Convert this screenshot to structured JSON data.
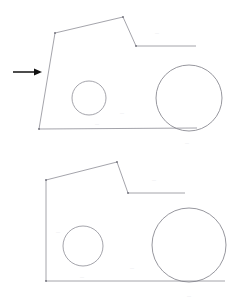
{
  "document": {
    "title": "CAD Profile Comparison Drawing",
    "background_color": "#ffffff",
    "width": 240,
    "height": 305,
    "line_color": "#8d8d95",
    "annotation_color": "#111111",
    "label_color": "#e2e2e6"
  },
  "figures": [
    {
      "id": "upper-figure",
      "name": "upper-profile-drawing",
      "description": "Profile outline with slanted left edge, small hole and large wheel circle",
      "outline": {
        "name": "upper-outline-path",
        "points": "55,33 123,17 136,46 196,46",
        "closed_segment": "55,33 39,129 197,128",
        "left_edge_type": "slanted"
      },
      "vertices": [
        {
          "name": "vertex-upper-left",
          "x": 55,
          "y": 33
        },
        {
          "name": "vertex-peak",
          "x": 123,
          "y": 17
        },
        {
          "name": "vertex-notch",
          "x": 136,
          "y": 46
        },
        {
          "name": "vertex-bottom-left",
          "x": 39,
          "y": 129
        }
      ],
      "circles": [
        {
          "name": "small-hole-circle",
          "cx": 89,
          "cy": 98,
          "r": 17
        },
        {
          "name": "large-wheel-circle",
          "cx": 189,
          "cy": 98,
          "r": 33
        }
      ],
      "labels": [
        {
          "name": "dim-label-top-right",
          "x": 155,
          "y": 33,
          "text": "—"
        },
        {
          "name": "dim-label-center",
          "x": 120,
          "y": 113,
          "text": "—"
        },
        {
          "name": "dim-label-bottom",
          "x": 95,
          "y": 124,
          "text": "—"
        },
        {
          "name": "dim-label-wheel",
          "x": 185,
          "y": 143,
          "text": "—"
        }
      ]
    },
    {
      "id": "lower-figure",
      "name": "lower-profile-drawing",
      "description": "Profile outline with vertical left edge, larger hole and larger wheel circle",
      "outline": {
        "name": "lower-outline-path",
        "points": "46,180 117,162 128,193 185,193",
        "closed_segment": "46,180 46,281 225,281",
        "left_edge_type": "vertical"
      },
      "vertices": [
        {
          "name": "vertex-upper-left",
          "x": 46,
          "y": 180
        },
        {
          "name": "vertex-peak",
          "x": 117,
          "y": 162
        },
        {
          "name": "vertex-notch",
          "x": 128,
          "y": 193
        },
        {
          "name": "vertex-bottom-left",
          "x": 46,
          "y": 281
        }
      ],
      "circles": [
        {
          "name": "small-hole-circle",
          "cx": 83,
          "cy": 246,
          "r": 20
        },
        {
          "name": "large-wheel-circle",
          "cx": 189,
          "cy": 245,
          "r": 37
        }
      ],
      "labels": [
        {
          "name": "dim-label-top-right",
          "x": 152,
          "y": 180,
          "text": "—"
        },
        {
          "name": "dim-label-left-edge",
          "x": 56,
          "y": 232,
          "text": "—"
        },
        {
          "name": "dim-label-center",
          "x": 130,
          "y": 268,
          "text": "—"
        },
        {
          "name": "dim-label-bottom",
          "x": 80,
          "y": 277,
          "text": "—"
        },
        {
          "name": "dim-label-wheel",
          "x": 187,
          "y": 296,
          "text": "—"
        }
      ]
    }
  ],
  "annotation": {
    "name": "callout-arrow",
    "description": "Black arrow pointing right at the slanted left edge of the upper profile",
    "line_start_x": 13,
    "line_start_y": 72,
    "line_end_x": 36,
    "line_end_y": 72,
    "head_points": "42,72 34,68.5 34,75.5",
    "color": "#111111"
  }
}
